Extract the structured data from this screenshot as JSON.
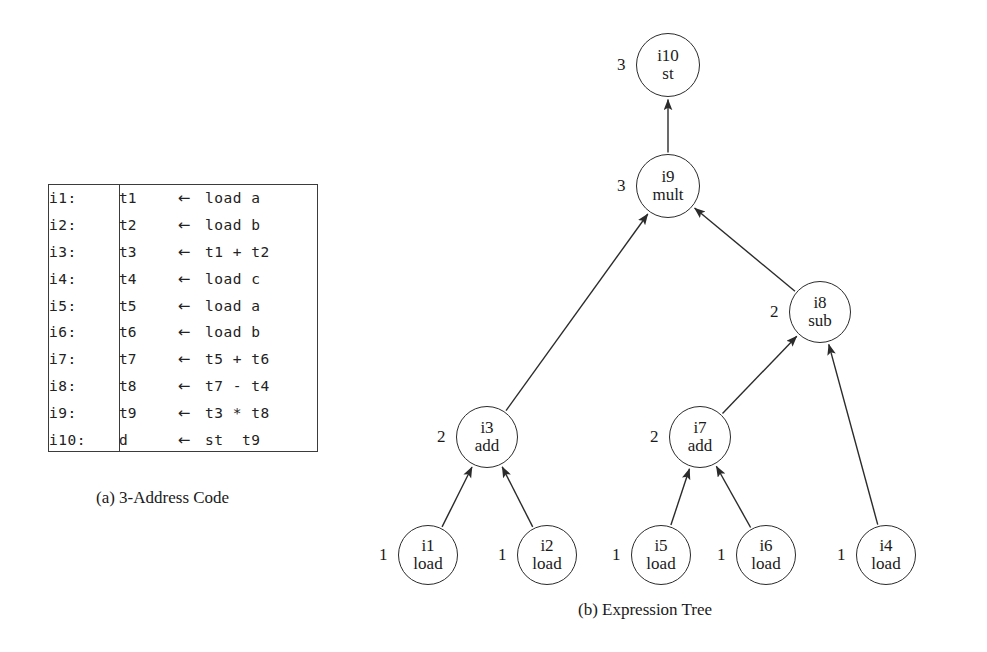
{
  "figure": {
    "panel_a_caption": "(a) 3-Address Code",
    "panel_b_caption": "(b) Expression Tree"
  },
  "code": {
    "arrow_glyph": "←",
    "lines": [
      {
        "label": "i1:",
        "dest": "t1",
        "arrow": "←",
        "expr": "load a"
      },
      {
        "label": "i2:",
        "dest": "t2",
        "arrow": "←",
        "expr": "load b"
      },
      {
        "label": "i3:",
        "dest": "t3",
        "arrow": "←",
        "expr": "t1 + t2"
      },
      {
        "label": "i4:",
        "dest": "t4",
        "arrow": "←",
        "expr": "load c"
      },
      {
        "label": "i5:",
        "dest": "t5",
        "arrow": "←",
        "expr": "load a"
      },
      {
        "label": "i6:",
        "dest": "t6",
        "arrow": "←",
        "expr": "load b"
      },
      {
        "label": "i7:",
        "dest": "t7",
        "arrow": "←",
        "expr": "t5 + t6"
      },
      {
        "label": "i8:",
        "dest": "t8",
        "arrow": "←",
        "expr": "t7 - t4"
      },
      {
        "label": "i9:",
        "dest": "t9",
        "arrow": "←",
        "expr": "t3 * t8"
      },
      {
        "label": "i10:",
        "dest": "d",
        "arrow": "←",
        "expr": "st  t9"
      }
    ]
  },
  "tree": {
    "nodes": [
      {
        "key": "i10",
        "id": "i10",
        "op": "st",
        "weight": "3",
        "cx": 668,
        "cy": 65,
        "r": 32
      },
      {
        "key": "i9",
        "id": "i9",
        "op": "mult",
        "weight": "3",
        "cx": 668,
        "cy": 186,
        "r": 32
      },
      {
        "key": "i8",
        "id": "i8",
        "op": "sub",
        "weight": "2",
        "cx": 820,
        "cy": 312,
        "r": 31
      },
      {
        "key": "i3",
        "id": "i3",
        "op": "add",
        "weight": "2",
        "cx": 487,
        "cy": 437,
        "r": 31
      },
      {
        "key": "i7",
        "id": "i7",
        "op": "add",
        "weight": "2",
        "cx": 700,
        "cy": 437,
        "r": 31
      },
      {
        "key": "i1",
        "id": "i1",
        "op": "load",
        "weight": "1",
        "cx": 428,
        "cy": 555,
        "r": 30
      },
      {
        "key": "i2",
        "id": "i2",
        "op": "load",
        "weight": "1",
        "cx": 547,
        "cy": 555,
        "r": 30
      },
      {
        "key": "i5",
        "id": "i5",
        "op": "load",
        "weight": "1",
        "cx": 661,
        "cy": 555,
        "r": 30
      },
      {
        "key": "i6",
        "id": "i6",
        "op": "load",
        "weight": "1",
        "cx": 766,
        "cy": 555,
        "r": 30
      },
      {
        "key": "i4",
        "id": "i4",
        "op": "load",
        "weight": "1",
        "cx": 886,
        "cy": 555,
        "r": 30
      }
    ],
    "edges": [
      {
        "from": "i9",
        "to": "i10"
      },
      {
        "from": "i3",
        "to": "i9"
      },
      {
        "from": "i8",
        "to": "i9"
      },
      {
        "from": "i7",
        "to": "i8"
      },
      {
        "from": "i4",
        "to": "i8"
      },
      {
        "from": "i1",
        "to": "i3"
      },
      {
        "from": "i2",
        "to": "i3"
      },
      {
        "from": "i5",
        "to": "i7"
      },
      {
        "from": "i6",
        "to": "i7"
      }
    ]
  }
}
